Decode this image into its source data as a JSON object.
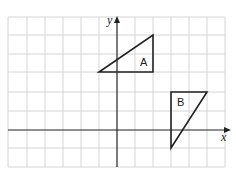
{
  "diagram": {
    "type": "coordinate-grid",
    "x_axis_label": "x",
    "y_axis_label": "y",
    "grid": {
      "x_min": -6,
      "x_max": 6,
      "y_min": -2,
      "y_max": 6
    },
    "shapes": [
      {
        "label": "A",
        "vertices": [
          [
            -1,
            3
          ],
          [
            2,
            3
          ],
          [
            2,
            5
          ]
        ]
      },
      {
        "label": "B",
        "vertices": [
          [
            3,
            2
          ],
          [
            5,
            2
          ],
          [
            3,
            -1
          ]
        ]
      }
    ]
  }
}
